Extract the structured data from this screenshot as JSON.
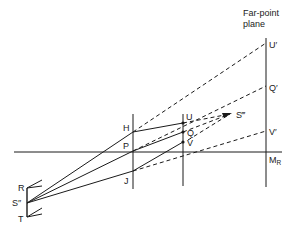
{
  "diagram": {
    "title_lines": [
      "Far-point",
      "plane"
    ],
    "points": {
      "R": "R",
      "S2": "S″",
      "T": "T",
      "H": "H",
      "P": "P",
      "J": "J",
      "U": "U",
      "Q": "Q",
      "V": "V",
      "S3": "S‴",
      "U1": "U′",
      "Q1": "Q′",
      "V1": "V′",
      "MR_main": "M",
      "MR_sub": "R"
    },
    "colors": {
      "line": "#1a1a1a",
      "background": "#ffffff"
    }
  }
}
